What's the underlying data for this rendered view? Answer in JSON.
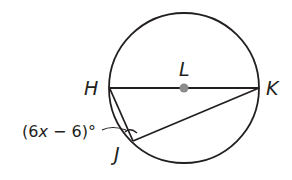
{
  "diagram": {
    "type": "circle-geometry",
    "circle": {
      "center_label": "L",
      "cx": 184,
      "cy": 88,
      "r": 75
    },
    "points": {
      "H": {
        "label": "H",
        "x": 109,
        "y": 88
      },
      "K": {
        "label": "K",
        "x": 259,
        "y": 88
      },
      "J": {
        "label": "J",
        "x": 133,
        "y": 141
      },
      "L": {
        "label": "L",
        "x": 184,
        "y": 88
      }
    },
    "segments": [
      {
        "from": "H",
        "to": "K",
        "note": "diameter through center L"
      },
      {
        "from": "H",
        "to": "J"
      },
      {
        "from": "J",
        "to": "K"
      }
    ],
    "angle_label": {
      "open": "(6",
      "var": "x",
      "rest": " − 6)°",
      "full": "(6x − 6)°",
      "at_vertex": "J"
    },
    "colors": {
      "stroke": "#231f20",
      "center_dot": "#8c8c8c",
      "background": "#ffffff"
    }
  }
}
